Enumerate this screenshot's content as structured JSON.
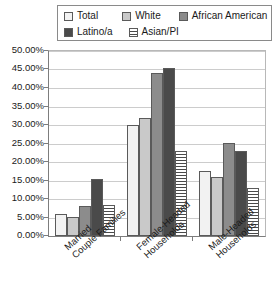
{
  "chart_data": {
    "type": "bar",
    "title": "",
    "xlabel": "",
    "ylabel": "",
    "ylim": [
      0,
      50
    ],
    "ytick_labels": [
      "50.00%",
      "45.00%",
      "40.00%",
      "35.00%",
      "30.00%",
      "25.00%",
      "20.00%",
      "15.00%",
      "10.00%",
      "5.00%",
      "0.00%"
    ],
    "ytick_values": [
      50,
      45,
      40,
      35,
      30,
      25,
      20,
      15,
      10,
      5,
      0
    ],
    "grid": true,
    "legend_position": "top",
    "categories": [
      "Married Couple Families",
      "Female-Headed Households",
      "Male-Headed Households"
    ],
    "category_lines": [
      [
        "Married",
        "Couple Families"
      ],
      [
        "Female-Headed",
        "Households"
      ],
      [
        "Male-Headed",
        "Households"
      ]
    ],
    "series": [
      {
        "name": "Total",
        "swatch": "fill-total",
        "color": "#f2f2f2",
        "values": [
          6.0,
          30.0,
          17.5
        ]
      },
      {
        "name": "White",
        "swatch": "fill-white",
        "color": "#c9c9c9",
        "values": [
          5.0,
          32.0,
          16.0
        ]
      },
      {
        "name": "African American",
        "swatch": "fill-afam",
        "color": "#8c8c8c",
        "values": [
          8.0,
          44.0,
          25.0
        ]
      },
      {
        "name": "Latino/a",
        "swatch": "fill-latino",
        "color": "#4a4a4a",
        "values": [
          15.5,
          45.5,
          23.0
        ]
      },
      {
        "name": "Asian/PI",
        "swatch": "fill-asian",
        "color": "#ffffff",
        "values": [
          8.5,
          23.0,
          13.0
        ]
      }
    ]
  },
  "legend": {
    "rows": [
      [
        "Total",
        "White",
        "African American"
      ],
      [
        "Latino/a",
        "Asian/PI"
      ]
    ]
  }
}
